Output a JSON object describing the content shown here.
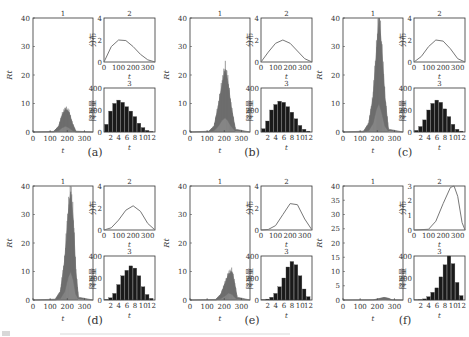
{
  "figure": {
    "rows": 2,
    "cols": 3,
    "panel_titles": [
      "1",
      "2",
      "3"
    ],
    "panel1_ylabel": "R_t",
    "panel2_ylabel": "分布",
    "panel3_ylabel": "降雨量",
    "xlabel": "t",
    "colors": {
      "trace": "#6e6e6e",
      "curve": "#777777",
      "bar": "#1a1a1a",
      "axis": "#333333"
    }
  },
  "chart_data": [
    {
      "id": "a",
      "caption": "(a)",
      "panels": [
        {
          "title": "1",
          "type": "area",
          "ylabel": "R_t",
          "xlabel": "t",
          "xlim": [
            0,
            350
          ],
          "ylim": [
            0,
            40
          ],
          "xticks": [
            0,
            100,
            200,
            300
          ],
          "yticks": [
            0,
            10,
            20,
            30,
            40
          ],
          "envelope": {
            "x": [
              0,
              120,
              150,
              170,
              190,
              210,
              230,
              250,
              350
            ],
            "upper": [
              0,
              0.2,
              2,
              6,
              8,
              7,
              3,
              0.3,
              0
            ],
            "lower": [
              0,
              0,
              0.5,
              1.5,
              2,
              1.5,
              0.5,
              0,
              0
            ]
          }
        },
        {
          "title": "2",
          "type": "line",
          "ylabel": "分布",
          "xlabel": "t",
          "xlim": [
            0,
            350
          ],
          "ylim": [
            0,
            4
          ],
          "xticks": [
            0,
            100,
            200,
            300
          ],
          "yticks": [
            0,
            2,
            4
          ],
          "x": [
            0,
            50,
            100,
            150,
            200,
            250,
            300,
            350
          ],
          "y": [
            0,
            1.4,
            2.0,
            1.95,
            1.4,
            0.7,
            0.2,
            0
          ]
        },
        {
          "title": "3",
          "type": "bar",
          "ylabel": "降雨量",
          "xlabel": "t",
          "ylim": [
            0,
            400
          ],
          "xticks": [
            2,
            4,
            6,
            8,
            10,
            12
          ],
          "yticks": [
            0,
            200,
            400
          ],
          "categories": [
            1,
            2,
            3,
            4,
            5,
            6,
            7,
            8,
            9,
            10,
            11,
            12
          ],
          "values": [
            70,
            190,
            260,
            290,
            270,
            230,
            190,
            140,
            80,
            40,
            15,
            5
          ]
        }
      ]
    },
    {
      "id": "b",
      "caption": "(b)",
      "panels": [
        {
          "title": "1",
          "type": "area",
          "ylabel": "R_t",
          "xlabel": "t",
          "xlim": [
            0,
            350
          ],
          "ylim": [
            0,
            40
          ],
          "xticks": [
            0,
            100,
            200,
            300
          ],
          "yticks": [
            0,
            10,
            20,
            30,
            40
          ],
          "envelope": {
            "x": [
              0,
              110,
              140,
              165,
              185,
              205,
              220,
              240,
              265,
              350
            ],
            "upper": [
              0,
              0.3,
              2,
              9,
              16,
              22,
              18,
              9,
              1,
              0
            ],
            "lower": [
              0,
              0,
              0.5,
              2,
              4,
              5,
              4,
              2,
              0.3,
              0
            ]
          }
        },
        {
          "title": "2",
          "type": "line",
          "ylabel": "分布",
          "xlabel": "t",
          "xlim": [
            0,
            350
          ],
          "ylim": [
            0,
            4
          ],
          "xticks": [
            0,
            100,
            200,
            300
          ],
          "yticks": [
            0,
            2,
            4
          ],
          "x": [
            0,
            50,
            100,
            150,
            200,
            250,
            300,
            350
          ],
          "y": [
            0,
            0.9,
            1.7,
            2.0,
            1.7,
            1.0,
            0.3,
            0
          ]
        },
        {
          "title": "3",
          "type": "bar",
          "ylabel": "降雨量",
          "xlabel": "t",
          "ylim": [
            0,
            400
          ],
          "xticks": [
            2,
            4,
            6,
            8,
            10,
            12
          ],
          "yticks": [
            0,
            200,
            400
          ],
          "categories": [
            1,
            2,
            3,
            4,
            5,
            6,
            7,
            8,
            9,
            10,
            11,
            12
          ],
          "values": [
            30,
            100,
            200,
            250,
            280,
            270,
            230,
            180,
            120,
            60,
            25,
            8
          ]
        }
      ]
    },
    {
      "id": "c",
      "caption": "(c)",
      "panels": [
        {
          "title": "1",
          "type": "area",
          "ylabel": "R_t",
          "xlabel": "t",
          "xlim": [
            0,
            350
          ],
          "ylim": [
            0,
            40
          ],
          "xticks": [
            0,
            100,
            200,
            300
          ],
          "yticks": [
            0,
            10,
            20,
            30,
            40
          ],
          "envelope": {
            "x": [
              0,
              120,
              150,
              175,
              195,
              210,
              225,
              245,
              265,
              350
            ],
            "upper": [
              0,
              0.3,
              3,
              12,
              28,
              40,
              30,
              12,
              1,
              0
            ],
            "lower": [
              0,
              0,
              0.5,
              3,
              8,
              10,
              7,
              2,
              0.3,
              0
            ]
          }
        },
        {
          "title": "2",
          "type": "line",
          "ylabel": "分布",
          "xlabel": "t",
          "xlim": [
            0,
            350
          ],
          "ylim": [
            0,
            4
          ],
          "xticks": [
            0,
            100,
            200,
            300
          ],
          "yticks": [
            0,
            2,
            4
          ],
          "x": [
            0,
            50,
            100,
            150,
            200,
            250,
            300,
            350
          ],
          "y": [
            0,
            0.5,
            1.4,
            2.0,
            1.9,
            1.2,
            0.3,
            0
          ]
        },
        {
          "title": "3",
          "type": "bar",
          "ylabel": "降雨量",
          "xlabel": "t",
          "ylim": [
            0,
            400
          ],
          "xticks": [
            2,
            4,
            6,
            8,
            10,
            12
          ],
          "yticks": [
            0,
            200,
            400
          ],
          "categories": [
            1,
            2,
            3,
            4,
            5,
            6,
            7,
            8,
            9,
            10,
            11,
            12
          ],
          "values": [
            15,
            50,
            110,
            200,
            260,
            290,
            270,
            210,
            140,
            70,
            25,
            8
          ]
        }
      ]
    },
    {
      "id": "d",
      "caption": "(d)",
      "panels": [
        {
          "title": "1",
          "type": "area",
          "ylabel": "R_t",
          "xlabel": "t",
          "xlim": [
            0,
            350
          ],
          "ylim": [
            0,
            40
          ],
          "xticks": [
            0,
            100,
            200,
            300
          ],
          "yticks": [
            0,
            10,
            20,
            30,
            40
          ],
          "envelope": {
            "x": [
              0,
              130,
              160,
              185,
              205,
              220,
              235,
              250,
              265,
              350
            ],
            "upper": [
              0,
              0.3,
              3,
              14,
              30,
              38,
              28,
              10,
              1,
              0
            ],
            "lower": [
              0,
              0,
              0.5,
              3,
              8,
              10,
              7,
              2,
              0.3,
              0
            ]
          }
        },
        {
          "title": "2",
          "type": "line",
          "ylabel": "分布",
          "xlabel": "t",
          "xlim": [
            0,
            350
          ],
          "ylim": [
            0,
            4
          ],
          "xticks": [
            0,
            100,
            200,
            300
          ],
          "yticks": [
            0,
            2,
            4
          ],
          "x": [
            0,
            50,
            100,
            150,
            200,
            250,
            300,
            350
          ],
          "y": [
            0,
            0.2,
            0.9,
            1.8,
            2.2,
            1.7,
            0.6,
            0
          ]
        },
        {
          "title": "3",
          "type": "bar",
          "ylabel": "降雨量",
          "xlabel": "t",
          "ylim": [
            0,
            400
          ],
          "xticks": [
            2,
            4,
            6,
            8,
            10,
            12
          ],
          "yticks": [
            0,
            200,
            400
          ],
          "categories": [
            1,
            2,
            3,
            4,
            5,
            6,
            7,
            8,
            9,
            10,
            11,
            12
          ],
          "values": [
            5,
            20,
            60,
            140,
            220,
            270,
            310,
            290,
            220,
            120,
            50,
            15
          ]
        }
      ]
    },
    {
      "id": "e",
      "caption": "(e)",
      "panels": [
        {
          "title": "1",
          "type": "area",
          "ylabel": "R_t",
          "xlabel": "t",
          "xlim": [
            0,
            350
          ],
          "ylim": [
            0,
            40
          ],
          "xticks": [
            0,
            100,
            200,
            300
          ],
          "yticks": [
            0,
            10,
            20,
            30,
            40
          ],
          "envelope": {
            "x": [
              0,
              150,
              180,
              205,
              225,
              245,
              260,
              275,
              350
            ],
            "upper": [
              0,
              0.2,
              2,
              6,
              9,
              10,
              6,
              1,
              0
            ],
            "lower": [
              0,
              0,
              0.5,
              1.5,
              2.5,
              2,
              1,
              0.2,
              0
            ]
          }
        },
        {
          "title": "2",
          "type": "line",
          "ylabel": "分布",
          "xlabel": "t",
          "xlim": [
            0,
            350
          ],
          "ylim": [
            0,
            4
          ],
          "xticks": [
            0,
            100,
            200,
            300
          ],
          "yticks": [
            0,
            2,
            4
          ],
          "x": [
            0,
            50,
            100,
            150,
            200,
            250,
            300,
            350
          ],
          "y": [
            0,
            0.05,
            0.4,
            1.4,
            2.4,
            2.3,
            1.0,
            0
          ]
        },
        {
          "title": "3",
          "type": "bar",
          "ylabel": "降雨量",
          "xlabel": "t",
          "ylim": [
            0,
            400
          ],
          "xticks": [
            2,
            4,
            6,
            8,
            10,
            12
          ],
          "yticks": [
            0,
            200,
            400
          ],
          "categories": [
            1,
            2,
            3,
            4,
            5,
            6,
            7,
            8,
            9,
            10,
            11,
            12
          ],
          "values": [
            3,
            8,
            25,
            60,
            120,
            200,
            300,
            350,
            320,
            220,
            100,
            30
          ]
        }
      ]
    },
    {
      "id": "f",
      "caption": "(f)",
      "panels": [
        {
          "title": "1",
          "type": "area",
          "ylabel": "R_t",
          "xlabel": "t",
          "xlim": [
            0,
            350
          ],
          "ylim": [
            0,
            40
          ],
          "xticks": [
            0,
            100,
            200,
            300
          ],
          "yticks": [
            0,
            5,
            10,
            15,
            20,
            25,
            30,
            35,
            40
          ],
          "envelope": {
            "x": [
              0,
              180,
              210,
              240,
              265,
              285,
              350
            ],
            "upper": [
              0,
              0.1,
              0.5,
              0.9,
              0.6,
              0.1,
              0
            ],
            "lower": [
              0,
              0,
              0.1,
              0.2,
              0.1,
              0,
              0
            ]
          }
        },
        {
          "title": "2",
          "type": "line",
          "ylabel": "分布",
          "xlabel": "t",
          "xlim": [
            0,
            350
          ],
          "ylim": [
            0,
            3
          ],
          "xticks": [
            0,
            100,
            200,
            300
          ],
          "yticks": [
            0,
            1,
            2,
            3
          ],
          "x": [
            0,
            100,
            150,
            200,
            250,
            275,
            300,
            330,
            350
          ],
          "y": [
            0,
            0.05,
            0.6,
            1.8,
            2.9,
            3.0,
            2.3,
            0.5,
            0
          ]
        },
        {
          "title": "3",
          "type": "bar",
          "ylabel": "降雨量",
          "xlabel": "t",
          "ylim": [
            0,
            400
          ],
          "xticks": [
            2,
            4,
            6,
            8,
            10,
            12
          ],
          "yticks": [
            0,
            200,
            400
          ],
          "categories": [
            1,
            2,
            3,
            4,
            5,
            6,
            7,
            8,
            9,
            10,
            11,
            12
          ],
          "values": [
            2,
            4,
            10,
            30,
            70,
            110,
            210,
            320,
            400,
            330,
            160,
            40
          ]
        }
      ]
    }
  ]
}
